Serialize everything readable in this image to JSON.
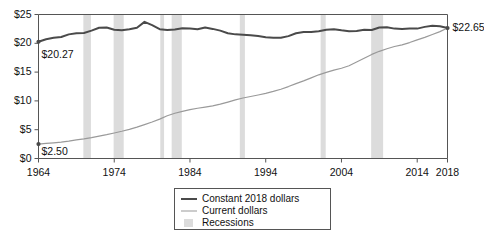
{
  "chart_data": {
    "type": "line",
    "title": "",
    "xlabel": "",
    "ylabel": "",
    "xlim": [
      1964,
      2018
    ],
    "ylim": [
      0,
      25
    ],
    "yticks": [
      0,
      5,
      10,
      15,
      20,
      25
    ],
    "ytick_labels": [
      "$0",
      "$5",
      "$10",
      "$15",
      "$20",
      "$25"
    ],
    "xticks": [
      1964,
      1974,
      1984,
      1994,
      2004,
      2014,
      2018
    ],
    "xtick_labels": [
      "1964",
      "1974",
      "1984",
      "1994",
      "2004",
      "2014",
      "2018"
    ],
    "grid": false,
    "legend_position": "bottom-center",
    "annotations": [
      {
        "text": "$20.27",
        "x": 1964,
        "y": 20.27,
        "series": "Constant 2018 dollars"
      },
      {
        "text": "$2.50",
        "x": 1964,
        "y": 2.5,
        "series": "Current dollars"
      },
      {
        "text": "$22.65",
        "x": 2018,
        "y": 22.65,
        "series": "both"
      }
    ],
    "series": [
      {
        "name": "Constant 2018 dollars",
        "color": "#4a4a4a",
        "x": [
          1964,
          1965,
          1966,
          1967,
          1968,
          1969,
          1970,
          1971,
          1972,
          1973,
          1974,
          1975,
          1976,
          1977,
          1978,
          1979,
          1980,
          1981,
          1982,
          1983,
          1984,
          1985,
          1986,
          1987,
          1988,
          1989,
          1990,
          1991,
          1992,
          1993,
          1994,
          1995,
          1996,
          1997,
          1998,
          1999,
          2000,
          2001,
          2002,
          2003,
          2004,
          2005,
          2006,
          2007,
          2008,
          2009,
          2010,
          2011,
          2012,
          2013,
          2014,
          2015,
          2016,
          2017,
          2018
        ],
        "values": [
          20.27,
          20.7,
          20.95,
          21.1,
          21.55,
          21.75,
          21.8,
          22.2,
          22.7,
          22.75,
          22.35,
          22.25,
          22.45,
          22.7,
          23.72,
          23.15,
          22.45,
          22.3,
          22.4,
          22.6,
          22.55,
          22.45,
          22.75,
          22.5,
          22.2,
          21.75,
          21.55,
          21.5,
          21.4,
          21.25,
          21.05,
          20.95,
          20.95,
          21.25,
          21.75,
          21.95,
          21.95,
          22.1,
          22.35,
          22.45,
          22.25,
          22.1,
          22.15,
          22.35,
          22.3,
          22.75,
          22.8,
          22.55,
          22.5,
          22.55,
          22.55,
          22.85,
          23.05,
          22.95,
          22.65
        ]
      },
      {
        "name": "Current dollars",
        "color": "#9a9a9a",
        "x": [
          1964,
          1965,
          1966,
          1967,
          1968,
          1969,
          1970,
          1971,
          1972,
          1973,
          1974,
          1975,
          1976,
          1977,
          1978,
          1979,
          1980,
          1981,
          1982,
          1983,
          1984,
          1985,
          1986,
          1987,
          1988,
          1989,
          1990,
          1991,
          1992,
          1993,
          1994,
          1995,
          1996,
          1997,
          1998,
          1999,
          2000,
          2001,
          2002,
          2003,
          2004,
          2005,
          2006,
          2007,
          2008,
          2009,
          2010,
          2011,
          2012,
          2013,
          2014,
          2015,
          2016,
          2017,
          2018
        ],
        "values": [
          2.5,
          2.61,
          2.72,
          2.85,
          3.02,
          3.22,
          3.4,
          3.63,
          3.9,
          4.14,
          4.43,
          4.73,
          5.06,
          5.44,
          5.87,
          6.33,
          6.84,
          7.43,
          7.86,
          8.19,
          8.48,
          8.73,
          8.92,
          9.13,
          9.43,
          9.8,
          10.19,
          10.5,
          10.76,
          11.03,
          11.32,
          11.64,
          12.03,
          12.49,
          13.0,
          13.47,
          14.0,
          14.53,
          14.95,
          15.35,
          15.67,
          16.11,
          16.75,
          17.42,
          18.07,
          18.61,
          19.05,
          19.44,
          19.74,
          20.13,
          20.6,
          21.03,
          21.52,
          22.03,
          22.65
        ]
      }
    ],
    "recessions": [
      {
        "label": "Recessions",
        "start": 1969.92,
        "end": 1970.92
      },
      {
        "label": "Recessions",
        "start": 1973.92,
        "end": 1975.25
      },
      {
        "label": "Recessions",
        "start": 1980.08,
        "end": 1980.58
      },
      {
        "label": "Recessions",
        "start": 1981.58,
        "end": 1982.92
      },
      {
        "label": "Recessions",
        "start": 1990.58,
        "end": 1991.25
      },
      {
        "label": "Recessions",
        "start": 2001.25,
        "end": 2001.92
      },
      {
        "label": "Recessions",
        "start": 2007.92,
        "end": 2009.5
      }
    ],
    "recession_color": "#dcdcdc",
    "axis_color": "#555555"
  },
  "legend": {
    "items": [
      {
        "label": "Constant 2018 dollars",
        "type": "line",
        "color": "#4a4a4a",
        "width": 2.2
      },
      {
        "label": "Current dollars",
        "type": "line",
        "color": "#9a9a9a",
        "width": 1.3
      },
      {
        "label": "Recessions",
        "type": "swatch",
        "color": "#dcdcdc"
      }
    ]
  }
}
